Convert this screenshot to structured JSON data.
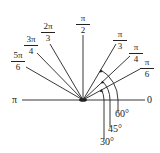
{
  "diagram": {
    "origin": [
      83,
      100
    ],
    "rays": [
      {
        "angle_deg": 0,
        "label": "0"
      },
      {
        "angle_deg": 30,
        "num": "π",
        "den": "6"
      },
      {
        "angle_deg": 45,
        "num": "π",
        "den": "4"
      },
      {
        "angle_deg": 60,
        "num": "π",
        "den": "3"
      },
      {
        "angle_deg": 90,
        "num": "π",
        "den": "2"
      },
      {
        "angle_deg": 120,
        "num": "2π",
        "den": "3"
      },
      {
        "angle_deg": 135,
        "num": "3π",
        "den": "4"
      },
      {
        "angle_deg": 150,
        "num": "5π",
        "den": "6"
      },
      {
        "angle_deg": 180,
        "label": "π"
      }
    ],
    "degree_arcs": [
      {
        "label": "60°"
      },
      {
        "label": "45°"
      },
      {
        "label": "30°"
      }
    ],
    "line_color": "#222222"
  }
}
